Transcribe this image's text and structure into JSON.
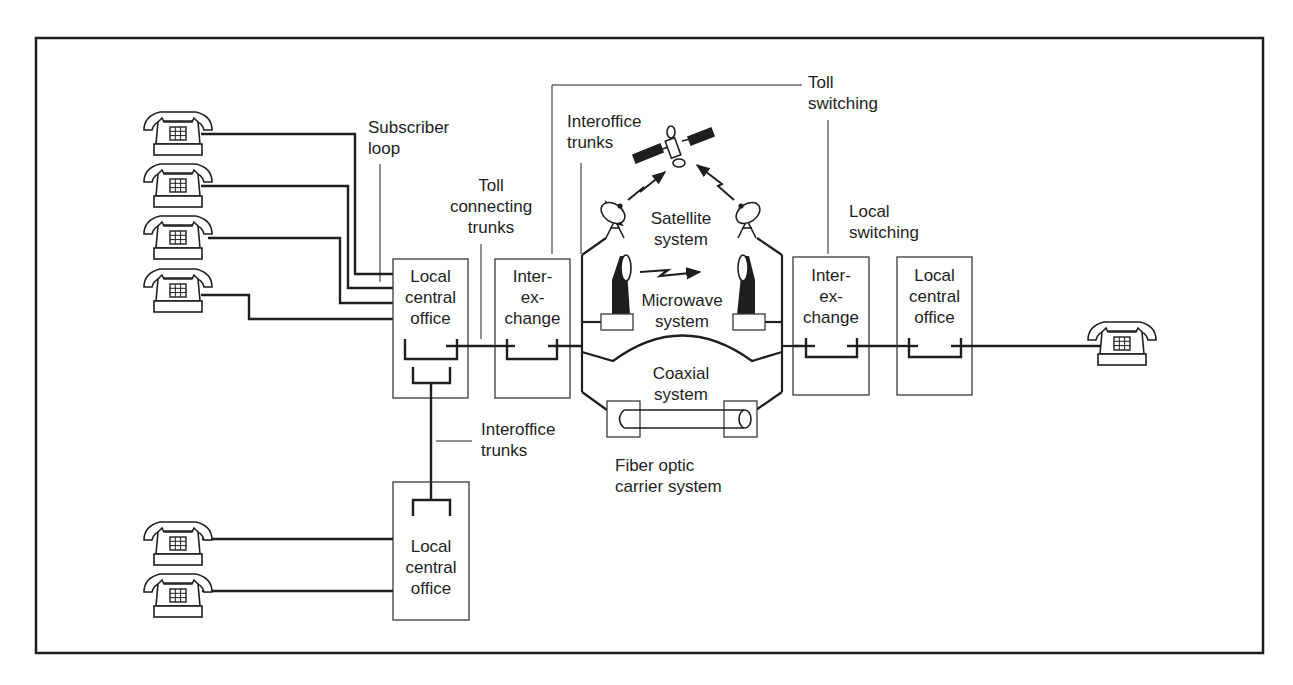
{
  "diagram": {
    "type": "telephone network overview",
    "colors": {
      "line": "#1e1e1e",
      "background": "#ffffff",
      "box_border": "#3a3a3a"
    },
    "labels": {
      "subscriber_loop": [
        "Subscriber",
        "loop"
      ],
      "toll_connecting_trunks": [
        "Toll",
        "connecting",
        "trunks"
      ],
      "interoffice_trunks_top": [
        "Interoffice",
        "trunks"
      ],
      "toll_switching": [
        "Toll",
        "switching"
      ],
      "local_switching": [
        "Local",
        "switching"
      ],
      "satellite_system": [
        "Satellite",
        "system"
      ],
      "microwave_system": [
        "Microwave",
        "system"
      ],
      "coaxial_system": [
        "Coaxial",
        "system"
      ],
      "fiber_optic": [
        "Fiber optic",
        "carrier system"
      ],
      "interoffice_trunks_bottom": [
        "Interoffice",
        "trunks"
      ]
    },
    "nodes": {
      "local_office_left": [
        "Local",
        "central",
        "office"
      ],
      "interexchange_left": [
        "Inter-",
        "ex-",
        "change"
      ],
      "interexchange_right": [
        "Inter-",
        "ex-",
        "change"
      ],
      "local_office_right": [
        "Local",
        "central",
        "office"
      ],
      "local_office_bottom": [
        "Local",
        "central",
        "office"
      ]
    },
    "telephones": {
      "left_group_count": 4,
      "bottom_group_count": 2,
      "right_count": 1
    }
  }
}
